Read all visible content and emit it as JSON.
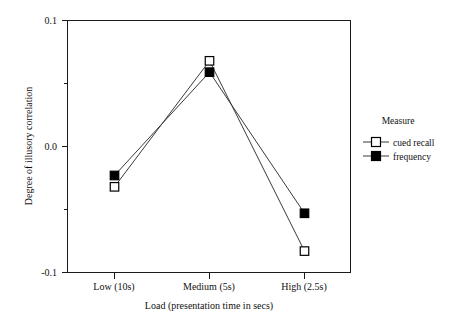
{
  "chart_data": {
    "type": "line",
    "title": "",
    "xlabel": "Load (presentation time in secs)",
    "ylabel": "Degree of illusory correlation",
    "categories": [
      "Low (10s)",
      "Medium (5s)",
      "High (2.5s)"
    ],
    "ylim": [
      -0.1,
      0.1
    ],
    "yticks": [
      "0.1",
      "0.0",
      "-0.1"
    ],
    "ytick_values": [
      0.1,
      0.0,
      -0.1
    ],
    "yminor_ticks": [
      0.05,
      -0.05
    ],
    "grid": false,
    "legend_position": "right",
    "legend_title": "Measure",
    "series": [
      {
        "name": "cued recall",
        "marker": "open-square",
        "values": [
          -0.032,
          0.068,
          -0.083
        ]
      },
      {
        "name": "frequency",
        "marker": "filled-square",
        "values": [
          -0.023,
          0.059,
          -0.053
        ]
      }
    ]
  },
  "axes": {
    "y_title": "Degree of illusory correlation",
    "x_title": "Load (presentation time in secs)",
    "y_tick_top": "0.1",
    "y_tick_mid": "0.0",
    "y_tick_bottom": "-0.1",
    "x_tick_1": "Low (10s)",
    "x_tick_2": "Medium (5s)",
    "x_tick_3": "High (2.5s)"
  },
  "legend": {
    "title": "Measure",
    "items": [
      {
        "label": "cued recall",
        "marker": "open-square"
      },
      {
        "label": "frequency",
        "marker": "filled-square"
      }
    ]
  },
  "colors": {
    "axis": "#1a1a1a",
    "line": "#3a3a3a",
    "marker_fill": "#000000",
    "marker_open_fill": "#ffffff",
    "background": "#ffffff"
  }
}
